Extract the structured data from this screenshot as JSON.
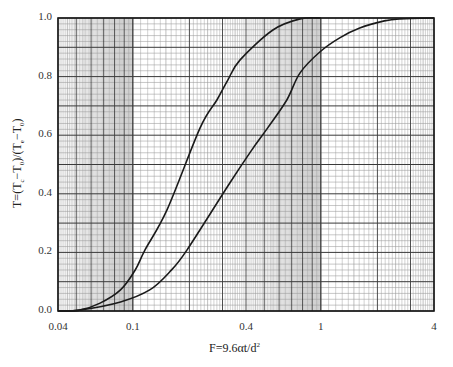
{
  "chart_data": {
    "type": "line",
    "title": "",
    "xlabel": "F=9.6αt/d²",
    "xlabel_parts": {
      "base": "F=9.6αt/d",
      "sup": "2"
    },
    "ylabel": "T=(Tc−T0)/(Te−T0)",
    "ylabel_parts": [
      "T=(T",
      "c",
      "−T",
      "0",
      ")/(T",
      "e",
      "−T",
      "0",
      ")"
    ],
    "xscale": "log",
    "xlim": [
      0.04,
      4
    ],
    "ylim": [
      0.0,
      1.0
    ],
    "grid": true,
    "legend": null,
    "x_tick_labels": [
      {
        "value": 0.04,
        "label": "0.04"
      },
      {
        "value": 0.1,
        "label": "0.1"
      },
      {
        "value": 0.4,
        "label": "0.4"
      },
      {
        "value": 1,
        "label": "1"
      },
      {
        "value": 4,
        "label": "4"
      }
    ],
    "y_tick_labels": [
      {
        "value": 0.0,
        "label": "0.0"
      },
      {
        "value": 0.2,
        "label": "0.2"
      },
      {
        "value": 0.4,
        "label": "0.4"
      },
      {
        "value": 0.6,
        "label": "0.6"
      },
      {
        "value": 0.8,
        "label": "0.8"
      },
      {
        "value": 1.0,
        "label": "1.0"
      }
    ],
    "series": [
      {
        "name": "curve-left",
        "x": [
          0.04,
          0.052,
          0.067,
          0.086,
          0.103,
          0.116,
          0.152,
          0.228,
          0.28,
          0.32,
          0.372,
          0.556,
          0.776,
          1.0
        ],
        "y": [
          0.0,
          0.003,
          0.027,
          0.072,
          0.14,
          0.208,
          0.345,
          0.625,
          0.72,
          0.788,
          0.857,
          0.959,
          0.997,
          1.0
        ]
      },
      {
        "name": "curve-right",
        "x": [
          0.04,
          0.052,
          0.086,
          0.123,
          0.157,
          0.194,
          0.328,
          0.429,
          0.522,
          0.659,
          0.774,
          0.988,
          1.26,
          1.61,
          2.18,
          2.64,
          4.0
        ],
        "y": [
          0.0,
          0.003,
          0.031,
          0.072,
          0.133,
          0.208,
          0.437,
          0.549,
          0.625,
          0.72,
          0.812,
          0.884,
          0.932,
          0.966,
          0.99,
          0.997,
          1.0
        ]
      }
    ]
  },
  "colors": {
    "curve": "#1a1a1a",
    "grid_minor": "#9a9a9a",
    "grid_major": "#3a3a3a",
    "frame": "#1a1a1a"
  }
}
